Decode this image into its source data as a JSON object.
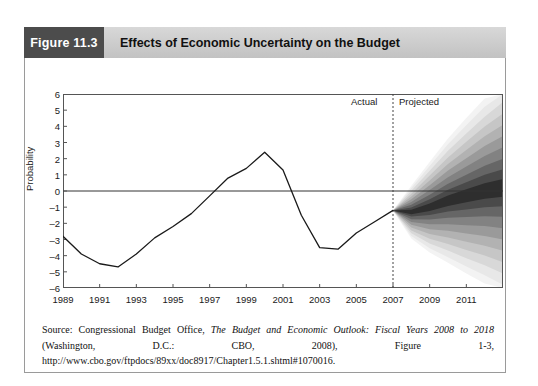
{
  "figure": {
    "tag": "Figure 11.3",
    "title": "Effects of Economic Uncertainty on the Budget",
    "tag_bg": "#4c4c4c",
    "title_bg": "#cccccc"
  },
  "source": {
    "prefix": "Source: Congressional Budget Office, ",
    "italic_title": "The Budget and Economic Outlook: Fiscal Years 2008 to 2018",
    "suffix": " (Washington, D.C.: CBO, 2008), Figure 1-3, http://www.cbo.gov/ftpdocs/89xx/doc8917/Chapter1.5.1.shtml#1070016."
  },
  "annotations": {
    "actual": "Actual",
    "projected": "Projected"
  },
  "chart_data": {
    "type": "line",
    "title": "Effects of Economic Uncertainty on the Budget",
    "xlabel": "",
    "ylabel": "Probability",
    "xlim": [
      1989,
      2013
    ],
    "ylim": [
      -6,
      6
    ],
    "grid": false,
    "legend": "none",
    "ytick_labels": [
      "6",
      "5",
      "4",
      "3",
      "2",
      "1",
      "0",
      "–1",
      "–2",
      "–3",
      "–4",
      "–5",
      "–6"
    ],
    "ytick_values": [
      6,
      5,
      4,
      3,
      2,
      1,
      0,
      -1,
      -2,
      -3,
      -4,
      -5,
      -6
    ],
    "xtick_labels": [
      "1989",
      "1991",
      "1993",
      "1995",
      "1997",
      "1999",
      "2001",
      "2003",
      "2005",
      "2007",
      "2009",
      "2011"
    ],
    "xtick_values": [
      1989,
      1991,
      1993,
      1995,
      1997,
      1999,
      2001,
      2003,
      2005,
      2007,
      2009,
      2011
    ],
    "divider_x": 2007,
    "zero_line_y": 0,
    "series": [
      {
        "name": "Actual surplus/deficit as share of GDP",
        "x": [
          1989,
          1990,
          1991,
          1992,
          1993,
          1994,
          1995,
          1996,
          1997,
          1998,
          1999,
          2000,
          2001,
          2002,
          2003,
          2004,
          2005,
          2006,
          2007
        ],
        "values": [
          -2.8,
          -3.9,
          -4.5,
          -4.7,
          -3.9,
          -2.9,
          -2.2,
          -1.4,
          -0.3,
          0.8,
          1.4,
          2.4,
          1.3,
          -1.5,
          -3.5,
          -3.6,
          -2.6,
          -1.9,
          -1.2
        ]
      }
    ],
    "fan": {
      "description": "Projected probability distribution fan, 2007-2013, bands from darkest (center) to lightest (outer)",
      "x": [
        2007,
        2008,
        2009,
        2010,
        2011,
        2012,
        2013
      ],
      "center": [
        -1.2,
        -1.3,
        -1.0,
        -0.6,
        -0.3,
        0.0,
        0.2
      ],
      "band_colors": [
        "#2e2e2e",
        "#4a4a4a",
        "#666666",
        "#828282",
        "#9a9a9a",
        "#b2b2b2",
        "#c6c6c6",
        "#d8d8d8",
        "#e8e8e8",
        "#f3f3f3"
      ],
      "band_half_widths_at_end": [
        0.55,
        1.15,
        1.8,
        2.5,
        3.2,
        3.9,
        4.6,
        5.3,
        6.0,
        6.6
      ]
    }
  }
}
